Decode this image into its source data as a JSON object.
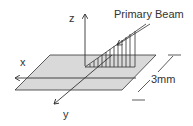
{
  "diagram": {
    "labels": {
      "z_axis": "z",
      "x_axis": "x",
      "y_axis": "y",
      "beam": "Primary Beam",
      "dimension": "3mm"
    },
    "colors": {
      "plane_fill": "#d9d9d9",
      "stroke": "#333333",
      "background": "#ffffff"
    }
  }
}
